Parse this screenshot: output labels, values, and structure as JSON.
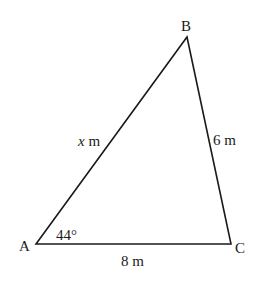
{
  "diagram": {
    "type": "triangle",
    "vertices": {
      "A": {
        "label": "A",
        "x": 36,
        "y": 244
      },
      "B": {
        "label": "B",
        "x": 187,
        "y": 37
      },
      "C": {
        "label": "C",
        "x": 231,
        "y": 244
      }
    },
    "sides": {
      "AB": {
        "var": "x",
        "unit": " m"
      },
      "BC": {
        "label": "6 m"
      },
      "AC": {
        "label": "8 m"
      }
    },
    "angles": {
      "A": {
        "label": "44°"
      }
    },
    "colors": {
      "stroke": "#1a1a1a",
      "background": "#ffffff"
    }
  }
}
